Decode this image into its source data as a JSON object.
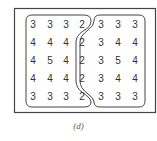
{
  "figure": {
    "caption": "(d)",
    "grid": [
      [
        "3",
        "3",
        "3",
        "2",
        "3",
        "3",
        "3"
      ],
      [
        "4",
        "4",
        "4",
        "2",
        "3",
        "4",
        "4"
      ],
      [
        "4",
        "5",
        "4",
        "2",
        "3",
        "5",
        "4"
      ],
      [
        "4",
        "4",
        "4",
        "2",
        "3",
        "4",
        "4"
      ],
      [
        "3",
        "3",
        "3",
        "2",
        "3",
        "3",
        "3"
      ]
    ],
    "regions": [
      {
        "name": "left-region",
        "columns": [
          0,
          1,
          2,
          3
        ]
      },
      {
        "name": "right-region",
        "columns": [
          4,
          5,
          6
        ]
      }
    ],
    "colors": {
      "stroke": "#444444",
      "text": "#333333",
      "background": "#ffffff"
    }
  }
}
